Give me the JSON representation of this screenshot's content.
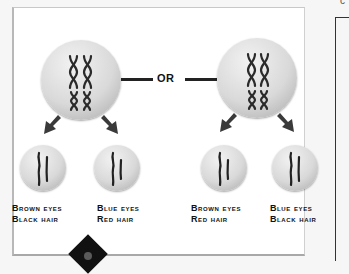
{
  "figure": {
    "topic": "independent assortment of chromosomes",
    "connector_label": "OR",
    "parent_cells": [
      {
        "id": "left",
        "arrangement": "arrangement-1"
      },
      {
        "id": "right",
        "arrangement": "arrangement-2"
      }
    ],
    "gametes": [
      {
        "line1": "Brown eyes",
        "line2": "Black hair"
      },
      {
        "line1": "Blue eyes",
        "line2": "Red hair"
      },
      {
        "line1": "Brown eyes",
        "line2": "Red hair"
      },
      {
        "line1": "Blue eyes",
        "line2": "Black hair"
      }
    ],
    "corner_glyph": "c"
  },
  "colors": {
    "text": "#111111",
    "cell_light": "#f2f2f2",
    "cell_dark": "#a9a9a9",
    "chromosome": "#2a2a2a",
    "arrow": "#3a3a3a"
  }
}
